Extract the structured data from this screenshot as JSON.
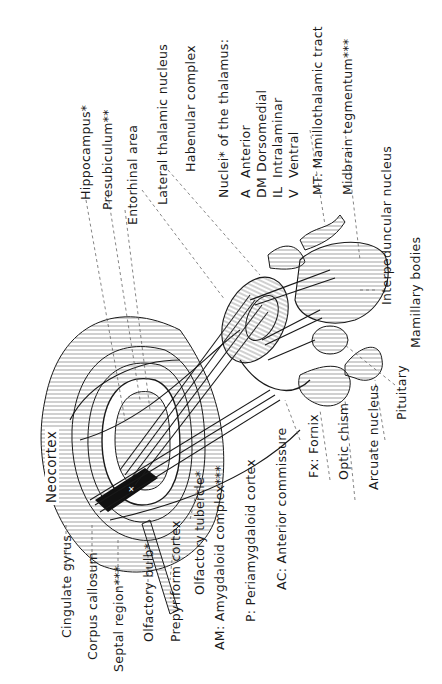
{
  "diagram": {
    "region_label": "Neocortex",
    "labels": {
      "hippocampus": "Hippocampus*",
      "presubiculum": "Presubiculum**",
      "entorhinal": "Entorhinal area",
      "lateral_thalamic": "Lateral thalamic nucleus",
      "habenular": "Habenular complex",
      "nuclei_heading": "Nuclei* of the thalamus:",
      "nuclei": [
        {
          "abbr": "A",
          "name": "Anterior"
        },
        {
          "abbr": "DM",
          "name": "Dorsomedial"
        },
        {
          "abbr": "IL",
          "name": "Intralaminar"
        },
        {
          "abbr": "V",
          "name": "Ventral"
        }
      ],
      "mt": "MT:  Mamillothalamic tract",
      "midbrain": "Midbrain tegmentum***",
      "interpeduncular": "Interpeduncular nucleus",
      "mamillary": "Mamillary bodies",
      "pituitary": "Pituitary",
      "arcuate": "Arcuate nucleus",
      "optic": "Optic chism",
      "fornix": "Fx: Fornix",
      "ac": "AC: Anterior commissure",
      "periamygdaloid": "P:  Periamygdaloid cortex",
      "amygdaloid": "AM:  Amygdaloid complex***",
      "olfactory_tubercle": "Olfactory tubercle*",
      "prepyriform": "Prepyriform cortex",
      "olfactory_bulb": "Olfactory bulb*",
      "septal": "Septal region***",
      "corpus": "Corpus callosum",
      "cingulate": "Cingulate gyrus"
    },
    "inner_marks": [
      "A",
      "DM",
      "IL",
      "V",
      "MT",
      "Fx",
      "AC",
      "P",
      "AM"
    ],
    "colors": {
      "ink": "#1a1a1a",
      "hatch": "#555555",
      "leader": "#666666"
    }
  }
}
